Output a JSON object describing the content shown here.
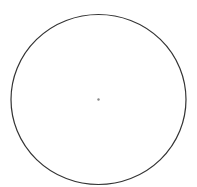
{
  "chart_data": {
    "type": "pie",
    "title": "",
    "categories": [
      "1",
      "2",
      "3",
      "4",
      "5",
      "6",
      "7",
      "8",
      "9",
      "10",
      "11",
      "12",
      "13",
      "14",
      "15",
      "16",
      "17",
      "18",
      "19",
      "20",
      "21",
      "22",
      "23",
      "24"
    ],
    "values": [
      1,
      1,
      1,
      1,
      1,
      1,
      1,
      1,
      1,
      1,
      1,
      1,
      1,
      1,
      1,
      1,
      1,
      1,
      1,
      1,
      1,
      1,
      1,
      1
    ],
    "slice_count": 24,
    "slice_angle_deg": 15,
    "legend": "none",
    "labels_visible": false,
    "geometry": {
      "cx": 98.5,
      "cy": 99.5,
      "rx": 87.5,
      "ry": 85
    },
    "colors": {
      "background": "#ffffff",
      "outline": "#333333",
      "spokes": "#cccccc",
      "fill": "#ffffff"
    }
  }
}
